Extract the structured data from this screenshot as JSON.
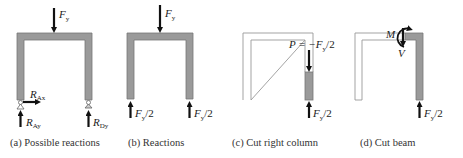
{
  "figure": {
    "colors": {
      "member_fill": "#9a9a9a",
      "member_stroke": "#777777",
      "outline_stroke": "#999999",
      "arrow": "#111111",
      "text": "#222222"
    },
    "panels": [
      {
        "id": "a",
        "caption": "(a) Possible reactions",
        "load_label": "F",
        "load_sub": "y",
        "reactions": [
          {
            "label": "R",
            "sub": "Ax",
            "direction": "right"
          },
          {
            "label": "R",
            "sub": "Ay",
            "direction": "up"
          },
          {
            "label": "R",
            "sub": "Dy",
            "direction": "up"
          }
        ]
      },
      {
        "id": "b",
        "caption": "(b) Reactions",
        "load_label": "F",
        "load_sub": "y",
        "reactions": [
          {
            "label": "F",
            "sub": "y",
            "suffix": "/2",
            "direction": "up"
          },
          {
            "label": "F",
            "sub": "y",
            "suffix": "/2",
            "direction": "up"
          }
        ]
      },
      {
        "id": "c",
        "caption": "(c) Cut right column",
        "internal_force": {
          "prefix": "P = −F",
          "sub": "y",
          "suffix": "/2"
        },
        "reaction": {
          "label": "F",
          "sub": "y",
          "suffix": "/2",
          "direction": "up"
        }
      },
      {
        "id": "d",
        "caption": "(d) Cut beam",
        "moment_label": "M",
        "shear_label": "V",
        "reaction": {
          "label": "F",
          "sub": "y",
          "suffix": "/2",
          "direction": "up"
        }
      }
    ]
  }
}
